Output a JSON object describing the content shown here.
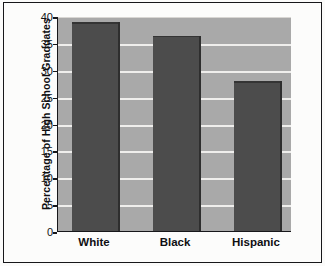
{
  "figure": {
    "kind": "bar-chart",
    "colors": {
      "plot_background": "#a9a9a9",
      "bar_fill": "#4c4c4c",
      "gridline": "#efeeec",
      "axis": "#17171a",
      "page_background": "#fcfcfb",
      "text": "#0f0f12"
    }
  },
  "chart_data": {
    "type": "bar",
    "title": "",
    "xlabel": "",
    "ylabel": "Percentage of High School Graduates",
    "categories": [
      "White",
      "Black",
      "Hispanic"
    ],
    "values": [
      39,
      36.5,
      28
    ],
    "ylim": [
      0,
      40
    ],
    "yticks": [
      0,
      5,
      10,
      15,
      20,
      25,
      30,
      35,
      40
    ],
    "ytick_labels": [
      "0",
      "5",
      "10",
      "15",
      "20",
      "25",
      "30",
      "35",
      "40"
    ],
    "grid": true,
    "legend": "none",
    "series": [
      {
        "name": "Percentage of High School Graduates",
        "values": [
          39,
          36.5,
          28
        ]
      }
    ]
  }
}
